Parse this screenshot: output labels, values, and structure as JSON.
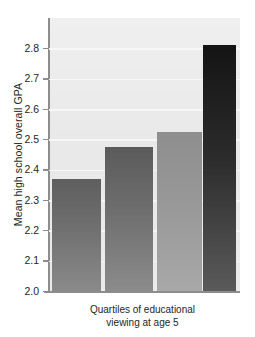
{
  "chart_data": {
    "type": "bar",
    "title": "",
    "subtitle": "",
    "xlabel": "Quartiles of educational\nviewing at age 5",
    "xlabel_line1": "Quartiles of educational",
    "xlabel_line2": "viewing at age 5",
    "ylabel": "Mean high school overall GPA",
    "categories": [
      "1",
      "2",
      "3",
      "4"
    ],
    "values": [
      2.37,
      2.475,
      2.525,
      2.81
    ],
    "ylim": [
      2.0,
      2.9
    ],
    "yticks": [
      "2.0",
      "2.1",
      "2.2",
      "2.3",
      "2.4",
      "2.5",
      "2.6",
      "2.7",
      "2.8"
    ],
    "ytick_values": [
      2.0,
      2.1,
      2.2,
      2.3,
      2.4,
      2.5,
      2.6,
      2.7,
      2.8
    ],
    "xtick_labels": [
      "",
      "",
      "",
      ""
    ],
    "grid": "horizontal",
    "legend": "none",
    "plot_background": "#e9e9e9",
    "gridline_color": "#f7f7f7",
    "axis_color": "#8d8d8d",
    "bar_colors": [
      "#6e6e6e",
      "#6b6b6b",
      "#989898",
      "#2b2b2b"
    ],
    "annotations": []
  }
}
